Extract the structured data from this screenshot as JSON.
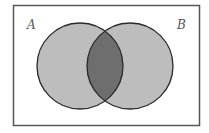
{
  "diagram": {
    "type": "venn",
    "title": "",
    "universe_frame": true,
    "sets": [
      {
        "label": "A",
        "fill": "#bdbdbd"
      },
      {
        "label": "B",
        "fill": "#bdbdbd"
      }
    ],
    "intersection": {
      "label": "A ∩ B",
      "fill": "#6e6e6e",
      "shaded": true
    },
    "colors": {
      "background": "#ffffff",
      "frame": "#555555",
      "outline": "#2a2a2a"
    }
  }
}
